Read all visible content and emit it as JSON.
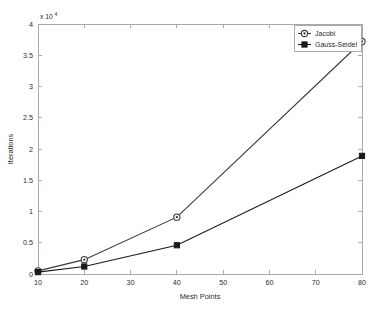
{
  "chart_data": {
    "type": "line",
    "title": "",
    "subtitle": "",
    "xlabel": "Mesh Points",
    "ylabel": "Iterations",
    "y_exponent_label": "x 10",
    "y_exponent_power": "4",
    "y_multiplier": 10000,
    "xlim": [
      10,
      80
    ],
    "ylim": [
      0,
      40000
    ],
    "xticks": [
      10,
      20,
      30,
      40,
      50,
      60,
      70,
      80
    ],
    "xticklabels": [
      "10",
      "20",
      "30",
      "40",
      "50",
      "60",
      "70",
      "80"
    ],
    "yticks": [
      0,
      5000,
      10000,
      15000,
      20000,
      25000,
      30000,
      35000,
      40000
    ],
    "yticklabels": [
      "0",
      "0.5",
      "1",
      "1.5",
      "2",
      "2.5",
      "3",
      "3.5",
      "4"
    ],
    "grid": false,
    "legend_position": "top-right",
    "x": [
      10,
      20,
      40,
      80
    ],
    "series": [
      {
        "name": "Jacobi",
        "marker": "circle-open",
        "color": "#3a3a3a",
        "values": [
          500,
          2300,
          9100,
          37200
        ]
      },
      {
        "name": "Gauss-Seidel",
        "marker": "square-filled",
        "color": "#1a1a1a",
        "values": [
          300,
          1200,
          4600,
          18900
        ]
      }
    ],
    "legend": [
      "Jacobi",
      "Gauss-Seidel"
    ]
  },
  "figure": {
    "background_color": "#ffffff",
    "axis_color": "#a9a9a9",
    "text_color": "#2b2b2b"
  }
}
